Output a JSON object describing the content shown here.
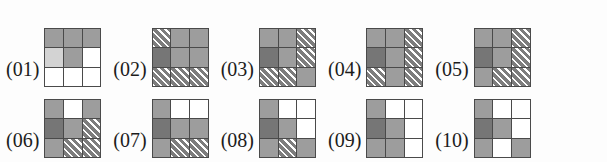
{
  "figure": {
    "title": "",
    "cell_legend": {
      "gray": "#9d9d9d",
      "light_gray": "#d3d3d3",
      "dark_gray": "#767676",
      "white": "#ffffff",
      "hatch": "diagonal-hatch"
    },
    "grid_size": "3x3",
    "rows": [
      {
        "name": "top-row",
        "items": [
          {
            "label": "(01)",
            "cells": [
              [
                "gray",
                "gray",
                "gray"
              ],
              [
                "lightgray",
                "gray",
                "white"
              ],
              [
                "white",
                "white",
                "white"
              ]
            ]
          },
          {
            "label": "(02)",
            "cells": [
              [
                "hatch",
                "gray",
                "gray"
              ],
              [
                "darkgray",
                "gray",
                "gray"
              ],
              [
                "hatch",
                "hatch",
                "hatch"
              ]
            ]
          },
          {
            "label": "(03)",
            "cells": [
              [
                "gray",
                "gray",
                "hatch"
              ],
              [
                "darkgray",
                "gray",
                "hatch"
              ],
              [
                "hatch",
                "hatch",
                "gray"
              ]
            ]
          },
          {
            "label": "(04)",
            "cells": [
              [
                "gray",
                "gray",
                "hatch"
              ],
              [
                "darkgray",
                "gray",
                "hatch"
              ],
              [
                "hatch",
                "gray",
                "hatch"
              ]
            ]
          },
          {
            "label": "(05)",
            "cells": [
              [
                "gray",
                "gray",
                "hatch"
              ],
              [
                "darkgray",
                "gray",
                "hatch"
              ],
              [
                "gray",
                "hatch",
                "hatch"
              ]
            ]
          }
        ]
      },
      {
        "name": "bottom-row",
        "items": [
          {
            "label": "(06)",
            "cells": [
              [
                "gray",
                "white",
                "gray"
              ],
              [
                "darkgray",
                "gray",
                "hatch"
              ],
              [
                "gray",
                "hatch",
                "hatch"
              ]
            ]
          },
          {
            "label": "(07)",
            "cells": [
              [
                "gray",
                "white",
                "white"
              ],
              [
                "darkgray",
                "gray",
                "gray"
              ],
              [
                "gray",
                "hatch",
                "hatch"
              ]
            ]
          },
          {
            "label": "(08)",
            "cells": [
              [
                "gray",
                "white",
                "white"
              ],
              [
                "darkgray",
                "gray",
                "white"
              ],
              [
                "gray",
                "hatch",
                "gray"
              ]
            ]
          },
          {
            "label": "(09)",
            "cells": [
              [
                "gray",
                "white",
                "white"
              ],
              [
                "darkgray",
                "gray",
                "white"
              ],
              [
                "gray",
                "gray",
                "white"
              ]
            ]
          },
          {
            "label": "(10)",
            "cells": [
              [
                "gray",
                "white",
                "white"
              ],
              [
                "darkgray",
                "gray",
                "white"
              ],
              [
                "gray",
                "white",
                "gray"
              ]
            ]
          }
        ]
      }
    ]
  }
}
